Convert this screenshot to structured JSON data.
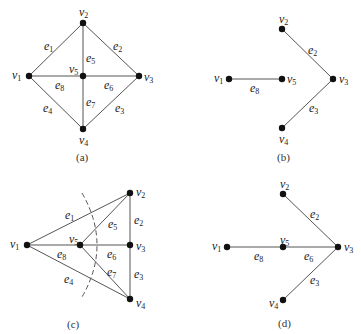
{
  "figure": {
    "panels": [
      {
        "id": "a",
        "caption": "(a)",
        "caption_pos": [
          76,
          151
        ],
        "vertices": [
          {
            "name": "v1",
            "x": 29,
            "y": 76,
            "lx": 12,
            "ly": 69
          },
          {
            "name": "v2",
            "x": 83,
            "y": 23,
            "lx": 79,
            "ly": 6
          },
          {
            "name": "v3",
            "x": 139,
            "y": 76,
            "lx": 144,
            "ly": 71
          },
          {
            "name": "v4",
            "x": 83,
            "y": 129,
            "lx": 79,
            "ly": 134
          },
          {
            "name": "v5",
            "x": 83,
            "y": 76,
            "lx": 69,
            "ly": 63
          }
        ],
        "edges": [
          {
            "name": "e1",
            "from": "v1",
            "to": "v2",
            "lx": 44,
            "ly": 40
          },
          {
            "name": "e2",
            "from": "v2",
            "to": "v3",
            "lx": 113,
            "ly": 40
          },
          {
            "name": "e3",
            "from": "v3",
            "to": "v4",
            "lx": 115,
            "ly": 102
          },
          {
            "name": "e4",
            "from": "v4",
            "to": "v1",
            "lx": 43,
            "ly": 102
          },
          {
            "name": "e5",
            "from": "v2",
            "to": "v5",
            "lx": 86,
            "ly": 52
          },
          {
            "name": "e6",
            "from": "v5",
            "to": "v3",
            "lx": 104,
            "ly": 79
          },
          {
            "name": "e7",
            "from": "v5",
            "to": "v4",
            "lx": 86,
            "ly": 96
          },
          {
            "name": "e8",
            "from": "v1",
            "to": "v5",
            "lx": 55,
            "ly": 79
          }
        ]
      },
      {
        "id": "b",
        "caption": "(b)",
        "caption_pos": [
          277,
          151
        ],
        "vertices": [
          {
            "name": "v1",
            "x": 229,
            "y": 79,
            "lx": 214,
            "ly": 72
          },
          {
            "name": "v2",
            "x": 282,
            "y": 29,
            "lx": 279,
            "ly": 13
          },
          {
            "name": "v3",
            "x": 333,
            "y": 79,
            "lx": 339,
            "ly": 73
          },
          {
            "name": "v4",
            "x": 282,
            "y": 128,
            "lx": 279,
            "ly": 133
          },
          {
            "name": "v5",
            "x": 282,
            "y": 79,
            "lx": 287,
            "ly": 73
          }
        ],
        "edges": [
          {
            "name": "e2",
            "from": "v2",
            "to": "v3",
            "lx": 308,
            "ly": 44
          },
          {
            "name": "e3",
            "from": "v3",
            "to": "v4",
            "lx": 309,
            "ly": 102
          },
          {
            "name": "e8",
            "from": "v1",
            "to": "v5",
            "lx": 250,
            "ly": 82
          }
        ]
      },
      {
        "id": "c",
        "caption": "(c)",
        "caption_pos": [
          67,
          318
        ],
        "vertices": [
          {
            "name": "v1",
            "x": 27,
            "y": 245,
            "lx": 10,
            "ly": 238
          },
          {
            "name": "v2",
            "x": 130,
            "y": 193,
            "lx": 136,
            "ly": 186
          },
          {
            "name": "v3",
            "x": 130,
            "y": 245,
            "lx": 136,
            "ly": 240
          },
          {
            "name": "v4",
            "x": 130,
            "y": 299,
            "lx": 136,
            "ly": 297
          },
          {
            "name": "v5",
            "x": 80,
            "y": 245,
            "lx": 69,
            "ly": 233
          }
        ],
        "edges": [
          {
            "name": "e1",
            "from": "v1",
            "to": "v2",
            "lx": 65,
            "ly": 209
          },
          {
            "name": "e2",
            "from": "v2",
            "to": "v3",
            "lx": 134,
            "ly": 214
          },
          {
            "name": "e3",
            "from": "v3",
            "to": "v4",
            "lx": 134,
            "ly": 268
          },
          {
            "name": "e4",
            "from": "v4",
            "to": "v1",
            "lx": 64,
            "ly": 273
          },
          {
            "name": "e5",
            "from": "v2",
            "to": "v5",
            "lx": 108,
            "ly": 218
          },
          {
            "name": "e6",
            "from": "v5",
            "to": "v3",
            "lx": 107,
            "ly": 248
          },
          {
            "name": "e7",
            "from": "v5",
            "to": "v4",
            "lx": 107,
            "ly": 266
          },
          {
            "name": "e8",
            "from": "v1",
            "to": "v5",
            "lx": 57,
            "ly": 248
          }
        ],
        "cut_arc": "M 82 193 Q 112 245 82 297"
      },
      {
        "id": "d",
        "caption": "(d)",
        "caption_pos": [
          278,
          317
        ],
        "vertices": [
          {
            "name": "v1",
            "x": 227,
            "y": 247,
            "lx": 212,
            "ly": 240
          },
          {
            "name": "v2",
            "x": 283,
            "y": 194,
            "lx": 280,
            "ly": 178
          },
          {
            "name": "v3",
            "x": 338,
            "y": 247,
            "lx": 344,
            "ly": 241
          },
          {
            "name": "v4",
            "x": 283,
            "y": 300,
            "lx": 269,
            "ly": 297
          },
          {
            "name": "v5",
            "x": 283,
            "y": 247,
            "lx": 280,
            "ly": 234
          }
        ],
        "edges": [
          {
            "name": "e2",
            "from": "v2",
            "to": "v3",
            "lx": 310,
            "ly": 208
          },
          {
            "name": "e3",
            "from": "v3",
            "to": "v4",
            "lx": 310,
            "ly": 274
          },
          {
            "name": "e6",
            "from": "v5",
            "to": "v3",
            "lx": 304,
            "ly": 250
          },
          {
            "name": "e8",
            "from": "v1",
            "to": "v5",
            "lx": 254,
            "ly": 250
          }
        ]
      }
    ]
  }
}
